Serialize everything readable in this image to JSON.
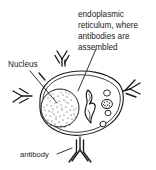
{
  "figure": {
    "background_color": "#ffffff",
    "ink_color": "#1a1a1a",
    "labels": {
      "nucleus": "Nucleus",
      "antibody": "antibody",
      "er_line_1": "endoplasmic",
      "er_line_2": "reticulum, where",
      "er_line_3": "antibodies are",
      "er_line_4": "assembled"
    },
    "parts": {
      "cell_membrane": "cell-membrane",
      "nucleus": "nucleus",
      "endoplasmic_reticulum": "endoplasmic-reticulum",
      "vesicles": "vesicles",
      "organelle": "dark-organelle",
      "antibodies": "antibody-y-shapes"
    },
    "antibody_count": 6
  }
}
